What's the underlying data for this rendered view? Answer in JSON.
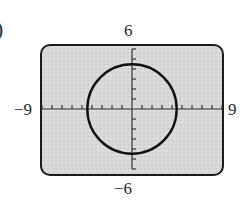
{
  "figure": {
    "edge_fragment": ")",
    "window": {
      "xmin_label": "−9",
      "xmax_label": "9",
      "ymin_label": "−6",
      "ymax_label": "6"
    },
    "colors": {
      "screen_fill": "#d9d9d9",
      "frame": "#1a1a1a",
      "curve": "#111111",
      "axes": "#333333"
    }
  },
  "chart_data": {
    "type": "line",
    "title": "",
    "xlabel": "",
    "ylabel": "",
    "xlim": [
      -9,
      9
    ],
    "ylim": [
      -6,
      6
    ],
    "xscl": 1,
    "yscl": 1,
    "grid": false,
    "tick_labels": {
      "x": [
        "−9",
        "9"
      ],
      "y": [
        "−6",
        "6"
      ]
    },
    "series": [
      {
        "name": "circle",
        "shape": "circle",
        "center": [
          0,
          0
        ],
        "radius": 4.47,
        "equation": "x^2 + y^2 = 20"
      }
    ]
  }
}
